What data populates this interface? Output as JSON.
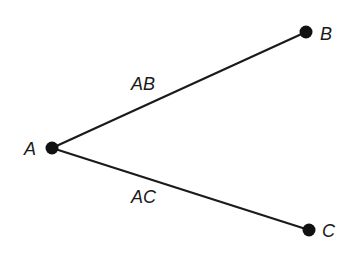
{
  "diagram": {
    "nodes": [
      {
        "id": "A",
        "label": "A",
        "x": 52,
        "y": 148
      },
      {
        "id": "B",
        "label": "B",
        "x": 306,
        "y": 32
      },
      {
        "id": "C",
        "label": "C",
        "x": 309,
        "y": 230
      }
    ],
    "edges": [
      {
        "from": "A",
        "to": "B",
        "label": "AB"
      },
      {
        "from": "A",
        "to": "C",
        "label": "AC"
      }
    ],
    "colors": {
      "line": "#1a1a1a",
      "node": "#111111",
      "background": "#ffffff"
    }
  }
}
